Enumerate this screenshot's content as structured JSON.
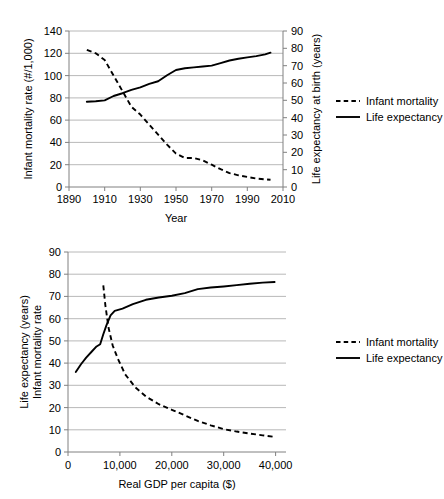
{
  "chart_data": [
    {
      "id": "time-series",
      "type": "line",
      "title": "",
      "xlabel": "Year",
      "ylabel": "Infant mortality rate (#/1,000)",
      "y2label": "Life expectancy at birth (years)",
      "xlim": [
        1890,
        2010
      ],
      "ylim": [
        0,
        140
      ],
      "y2lim": [
        0,
        90
      ],
      "xticks": [
        "1890",
        "1910",
        "1930",
        "1950",
        "1970",
        "1990",
        "2010"
      ],
      "xtick_values": [
        1890,
        1910,
        1930,
        1950,
        1970,
        1990,
        2010
      ],
      "yticks": [
        "0",
        "20",
        "40",
        "60",
        "80",
        "100",
        "120",
        "140"
      ],
      "ytick_values": [
        0,
        20,
        40,
        60,
        80,
        100,
        120,
        140
      ],
      "y2ticks": [
        "0",
        "10",
        "20",
        "30",
        "40",
        "50",
        "60",
        "70",
        "80",
        "90"
      ],
      "y2tick_values": [
        0,
        10,
        20,
        30,
        40,
        50,
        60,
        70,
        80,
        90
      ],
      "grid": true,
      "legend_position": "right",
      "series": [
        {
          "name": "Infant mortality",
          "style": "dashed",
          "axis": "left",
          "x": [
            1900,
            1905,
            1910,
            1915,
            1920,
            1925,
            1930,
            1935,
            1940,
            1945,
            1950,
            1955,
            1960,
            1965,
            1970,
            1975,
            1980,
            1985,
            1990,
            1995,
            2000,
            2003
          ],
          "values": [
            123,
            120,
            114,
            100,
            86,
            72,
            65,
            56,
            47,
            38,
            30,
            26,
            26,
            24,
            20,
            16,
            12.5,
            10.5,
            9.0,
            7.6,
            6.9,
            6.5
          ]
        },
        {
          "name": "Life expectancy",
          "style": "solid",
          "axis": "right",
          "x": [
            1900,
            1905,
            1910,
            1915,
            1920,
            1925,
            1930,
            1935,
            1940,
            1945,
            1950,
            1955,
            1960,
            1965,
            1970,
            1975,
            1980,
            1985,
            1990,
            1995,
            2000,
            2003
          ],
          "values": [
            49.2,
            49.5,
            50.0,
            52.5,
            54.1,
            56.0,
            57.5,
            59.5,
            61.0,
            64.5,
            67.5,
            68.5,
            69.0,
            69.5,
            70.0,
            71.5,
            73.0,
            74.0,
            74.8,
            75.5,
            76.5,
            77.5
          ]
        }
      ]
    },
    {
      "id": "gdp-cross-section",
      "type": "line",
      "title": "",
      "xlabel": "Real GDP per capita ($)",
      "ylabel": "Life expectancy (years)\nInfant mortality rate",
      "ylabel_line1": "Life expectancy (years)",
      "ylabel_line2": "Infant mortality rate",
      "xlim": [
        0,
        42000
      ],
      "ylim": [
        0,
        90
      ],
      "xticks": [
        "0",
        "10,000",
        "20,000",
        "30,000",
        "40,000"
      ],
      "xtick_values": [
        0,
        10000,
        20000,
        30000,
        40000
      ],
      "yticks": [
        "0",
        "10",
        "20",
        "30",
        "40",
        "50",
        "60",
        "70",
        "80",
        "90"
      ],
      "ytick_values": [
        0,
        10,
        20,
        30,
        40,
        50,
        60,
        70,
        80,
        90
      ],
      "grid": true,
      "legend_position": "right",
      "series": [
        {
          "name": "Infant mortality",
          "style": "dashed",
          "x": [
            6800,
            7200,
            7800,
            8600,
            9600,
            11000,
            13000,
            15000,
            17500,
            20000,
            22500,
            25000,
            27500,
            30000,
            32500,
            35000,
            37500,
            39800
          ],
          "values": [
            75,
            66,
            56,
            48,
            42,
            35,
            29,
            25,
            21.5,
            19,
            16.5,
            14,
            12,
            10.3,
            9.2,
            8.3,
            7.5,
            6.8
          ]
        },
        {
          "name": "Life expectancy",
          "style": "solid",
          "x": [
            1500,
            2500,
            3500,
            4500,
            5500,
            6200,
            6800,
            7400,
            8200,
            9000,
            10500,
            12500,
            15000,
            17500,
            20000,
            22500,
            25000,
            27500,
            30000,
            32500,
            35000,
            37500,
            39800
          ],
          "values": [
            36,
            39.5,
            42.5,
            45,
            47.5,
            48.5,
            53,
            57,
            61.5,
            63.5,
            64.5,
            66.5,
            68.5,
            69.5,
            70.3,
            71.5,
            73.3,
            74,
            74.5,
            75.1,
            75.7,
            76.2,
            76.5
          ]
        }
      ]
    }
  ],
  "charts": {
    "top": {
      "xlabel": "Year",
      "ylabel": "Infant mortality rate (#/1,000)",
      "y2label": "Life expectancy at birth (years)",
      "legend": [
        {
          "label": "Infant mortality",
          "style": "dashed"
        },
        {
          "label": "Life expectancy",
          "style": "solid"
        }
      ]
    },
    "bottom": {
      "xlabel": "Real GDP per capita ($)",
      "ylabel_line1": "Life expectancy (years)",
      "ylabel_line2": "Infant mortality rate",
      "legend": [
        {
          "label": "Infant mortality",
          "style": "dashed"
        },
        {
          "label": "Life expectancy",
          "style": "solid"
        }
      ]
    }
  },
  "colors": {
    "series": "#000000",
    "grid": "#a6a6a6",
    "axis": "#808080",
    "background": "#ffffff"
  }
}
